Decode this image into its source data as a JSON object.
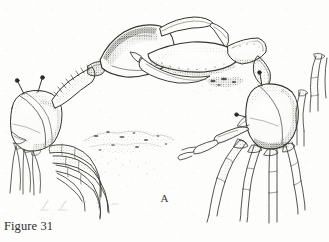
{
  "figure": {
    "caption": "Figure 31",
    "panel_label": "A",
    "medium": "pen-and-ink stipple line drawing",
    "palette": {
      "paper": "#fdfdfc",
      "ink_dark": "#2b2b29",
      "ink_mid": "#6b6b66",
      "ink_light": "#a8a8a2",
      "stipple": "#7d7d77"
    }
  },
  "scene": {
    "description": "Two fiddler crabs facing each other with their enlarged major chelae raised and interlocked in combat, standing on stippled sand substrate",
    "subjects": [
      {
        "id": "crab-left",
        "name": "left crab",
        "facing": "right",
        "features": [
          "carapace",
          "two raised eyestalks",
          "major cheliped raised and extended right",
          "four walking legs"
        ]
      },
      {
        "id": "crab-right",
        "name": "right crab",
        "facing": "left",
        "features": [
          "carapace",
          "eyestalk",
          "major cheliped raised and extended left",
          "minor cheliped",
          "four walking legs"
        ]
      },
      {
        "id": "crab-partial",
        "name": "partial crab at right margin",
        "facing": "unknown",
        "features": [
          "cropped walking legs"
        ]
      }
    ],
    "substrate": {
      "name": "sand-substrate",
      "texture": "stippled ground with scattered debris"
    }
  }
}
